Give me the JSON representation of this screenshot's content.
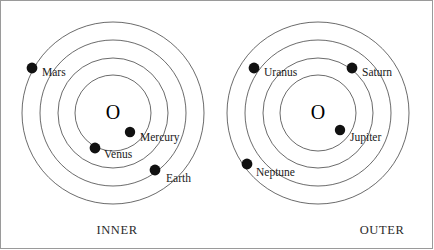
{
  "figure": {
    "width": 434,
    "height": 250,
    "background_color": "#ffffff",
    "border_color": "#9a9a9a",
    "orbit_stroke_color": "#2b2b2b",
    "planet_fill_color": "#111111",
    "label_text_color": "#1a1a1a"
  },
  "systems": [
    {
      "id": "inner-system",
      "caption": "INNER",
      "caption_x": 117,
      "caption_y": 234,
      "center": {
        "x": 113,
        "y": 113,
        "glyph": "O"
      },
      "orbit_radii": [
        38,
        55,
        73,
        91
      ],
      "planets": [
        {
          "name": "Mars",
          "dot_x": 32,
          "dot_y": 68,
          "dot_r": 5.4,
          "label_x": 42,
          "label_y": 76,
          "orbit_index": 3
        },
        {
          "name": "Mercury",
          "dot_x": 130,
          "dot_y": 132,
          "dot_r": 5.2,
          "label_x": 140,
          "label_y": 141,
          "orbit_index": 0
        },
        {
          "name": "Venus",
          "dot_x": 95,
          "dot_y": 148,
          "dot_r": 5.4,
          "label_x": 104,
          "label_y": 158,
          "orbit_index": 1
        },
        {
          "name": "Earth",
          "dot_x": 155,
          "dot_y": 170,
          "dot_r": 5.4,
          "label_x": 166,
          "label_y": 182,
          "orbit_index": 2
        }
      ]
    },
    {
      "id": "outer-system",
      "caption": "OUTER",
      "caption_x": 382,
      "caption_y": 234,
      "center": {
        "x": 318,
        "y": 113,
        "glyph": "O"
      },
      "orbit_radii": [
        38,
        55,
        73,
        91
      ],
      "planets": [
        {
          "name": "Uranus",
          "dot_x": 254,
          "dot_y": 68,
          "dot_r": 5.4,
          "label_x": 264,
          "label_y": 76,
          "orbit_index": 3
        },
        {
          "name": "Saturn",
          "dot_x": 352,
          "dot_y": 68,
          "dot_r": 5.4,
          "label_x": 362,
          "label_y": 76,
          "orbit_index": 2
        },
        {
          "name": "Jupiter",
          "dot_x": 340,
          "dot_y": 130,
          "dot_r": 5.2,
          "label_x": 350,
          "label_y": 141,
          "orbit_index": 0
        },
        {
          "name": "Neptune",
          "dot_x": 247,
          "dot_y": 164,
          "dot_r": 5.4,
          "label_x": 256,
          "label_y": 176,
          "orbit_index": 3
        }
      ]
    }
  ]
}
